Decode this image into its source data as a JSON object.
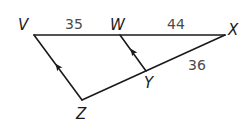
{
  "diagram": {
    "type": "triangle-with-parallel-segment",
    "points": {
      "V": {
        "label": "V"
      },
      "W": {
        "label": "W"
      },
      "X": {
        "label": "X"
      },
      "Y": {
        "label": "Y"
      },
      "Z": {
        "label": "Z"
      }
    },
    "segments": [
      {
        "from": "V",
        "to": "W",
        "length_label": "35"
      },
      {
        "from": "W",
        "to": "X",
        "length_label": "44"
      },
      {
        "from": "Y",
        "to": "X",
        "length_label": "36"
      },
      {
        "from": "V",
        "to": "Z",
        "parallel_mark": "single-arrow"
      },
      {
        "from": "W",
        "to": "Y",
        "parallel_mark": "single-arrow"
      },
      {
        "from": "Z",
        "to": "Y"
      }
    ],
    "labels": {
      "V": "V",
      "W": "W",
      "X": "X",
      "Y": "Y",
      "Z": "Z",
      "VW": "35",
      "WX": "44",
      "YX": "36"
    }
  }
}
